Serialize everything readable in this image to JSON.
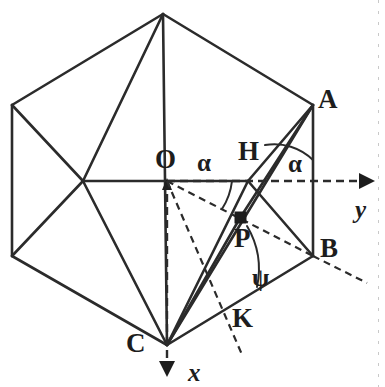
{
  "figure": {
    "background_color": "#ffffff",
    "stroke_color": "#2b2b2b",
    "width": 385,
    "height": 387,
    "vertices": {
      "top": {
        "x": 163,
        "y": 14,
        "label": ""
      },
      "upper_left": {
        "x": 12,
        "y": 105,
        "label": ""
      },
      "lower_left": {
        "x": 12,
        "y": 256,
        "label": ""
      },
      "A": {
        "x": 313,
        "y": 105,
        "label": "A"
      },
      "B": {
        "x": 313,
        "y": 256,
        "label": "B"
      },
      "C": {
        "x": 167,
        "y": 345,
        "label": "C"
      },
      "O": {
        "x": 167,
        "y": 181,
        "label": "O"
      },
      "H": {
        "x": 248,
        "y": 181,
        "label": "H"
      },
      "P": {
        "x": 240,
        "y": 218,
        "label": "P"
      },
      "center_left": {
        "x": 83,
        "y": 181,
        "label": ""
      }
    },
    "labels": [
      {
        "name": "vertex-label-A",
        "text": "A",
        "x": 318,
        "y": 86,
        "kind": "vertex"
      },
      {
        "name": "vertex-label-B",
        "text": "B",
        "x": 320,
        "y": 235,
        "kind": "vertex"
      },
      {
        "name": "vertex-label-C",
        "text": "C",
        "x": 126,
        "y": 330,
        "kind": "vertex"
      },
      {
        "name": "vertex-label-O",
        "text": "O",
        "x": 155,
        "y": 146,
        "kind": "vertex"
      },
      {
        "name": "vertex-label-H",
        "text": "H",
        "x": 238,
        "y": 138,
        "kind": "vertex"
      },
      {
        "name": "vertex-label-P",
        "text": "P",
        "x": 234,
        "y": 225,
        "kind": "vertex"
      },
      {
        "name": "vertex-label-K",
        "text": "K",
        "x": 232,
        "y": 305,
        "kind": "vertex"
      },
      {
        "name": "angle-label-alpha-at-O",
        "text": "α",
        "x": 197,
        "y": 150,
        "kind": "greek"
      },
      {
        "name": "angle-label-alpha-at-A",
        "text": "α",
        "x": 288,
        "y": 151,
        "kind": "greek"
      },
      {
        "name": "angle-label-psi-at-B",
        "text": "ψ",
        "x": 252,
        "y": 265,
        "kind": "greek"
      },
      {
        "name": "axis-label-y",
        "text": "y",
        "x": 355,
        "y": 197,
        "kind": "axis"
      },
      {
        "name": "axis-label-x",
        "text": "x",
        "x": 188,
        "y": 360,
        "kind": "axis"
      }
    ],
    "axes": [
      {
        "name": "y-axis",
        "from": "O",
        "direction": "right",
        "tip_x": 370,
        "tip_y": 181,
        "style": "dashed",
        "label": "y"
      },
      {
        "name": "x-axis",
        "from": "O",
        "direction": "down",
        "tip_x": 167,
        "tip_y": 376,
        "style": "dashed",
        "label": "x"
      }
    ],
    "angles": [
      {
        "name": "alpha-at-O",
        "symbol": "α",
        "vertex": "O",
        "between": [
          "OH",
          "OB"
        ]
      },
      {
        "name": "alpha-at-A",
        "symbol": "α",
        "vertex": "A",
        "between": [
          "AB",
          "A-y-parallel"
        ]
      },
      {
        "name": "psi-at-B",
        "symbol": "ψ",
        "vertex": "B",
        "between": [
          "BC",
          "BP"
        ]
      }
    ],
    "solid_segments": [
      "hexagon-top-to-upper-left",
      "hexagon-upper-left-to-lower-left",
      "hexagon-lower-left-to-C",
      "hexagon-C-to-B",
      "hexagon-B-to-A",
      "hexagon-A-to-top",
      "top-to-center-left",
      "top-to-C",
      "top-to-A-diagonal",
      "upper-left-to-center-left",
      "lower-left-to-center-left",
      "center-left-to-C",
      "center-left-to-H",
      "C-to-A",
      "C-to-H",
      "C-to-P-A",
      "A-to-H",
      "A-to-C-inner",
      "H-to-B"
    ],
    "dashed_segments": [
      "O-to-y-axis",
      "O-to-x-axis",
      "O-to-B-dashed",
      "O-to-K-dashed",
      "P-to-B-dashed",
      "B-to-lower-right-dashed",
      "K-line-dashed"
    ]
  }
}
